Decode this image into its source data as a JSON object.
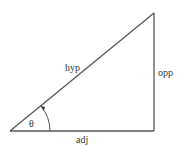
{
  "diagram": {
    "type": "right-triangle",
    "labels": {
      "hypotenuse": "hyp",
      "opposite": "opp",
      "adjacent": "adj",
      "angle": "θ"
    },
    "colors": {
      "line": "#555555",
      "text": "#333333"
    }
  }
}
